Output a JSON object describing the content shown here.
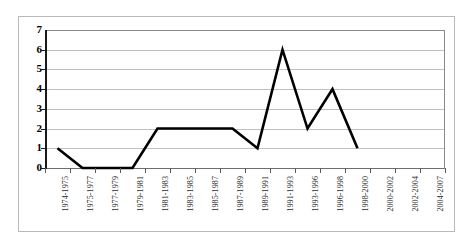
{
  "chart_data": {
    "type": "line",
    "title": "",
    "subtitle": "",
    "xlabel": "",
    "ylabel": "",
    "categories": [
      "1974-1975",
      "1975-1977",
      "1977-1979",
      "1979-1981",
      "1981-1983",
      "1983-1985",
      "1985-1987",
      "1987-1989",
      "1989-1991",
      "1991-1993",
      "1993-1996",
      "1996-1998",
      "1998-2000",
      "2000-2002",
      "2002-2004",
      "2004-2007"
    ],
    "values": [
      1,
      0,
      0,
      0,
      2,
      2,
      2,
      2,
      1,
      6,
      2,
      4,
      1,
      null,
      null,
      null
    ],
    "series": [
      {
        "name": "",
        "values": [
          1,
          0,
          0,
          0,
          2,
          2,
          2,
          2,
          1,
          6,
          2,
          4,
          1,
          null,
          null,
          null
        ]
      }
    ],
    "ylim": [
      0,
      7
    ],
    "y_ticks": [
      0,
      1,
      2,
      3,
      4,
      5,
      6,
      7
    ],
    "y_tick_labels": [
      "0",
      "1",
      "2",
      "3",
      "4",
      "5",
      "6",
      "7"
    ],
    "grid": true,
    "grid_axis": "y",
    "legend": false,
    "legend_position": "none",
    "markers": false,
    "line_color": "#000000",
    "line_width": 2.6,
    "gridline_color": "#c0c0c0",
    "axis_color": "#1a1a1a",
    "plot_background": "#ffffff",
    "frame_color": "#b9b9b9",
    "x_tick_label_rotation": -90,
    "annotations": []
  }
}
